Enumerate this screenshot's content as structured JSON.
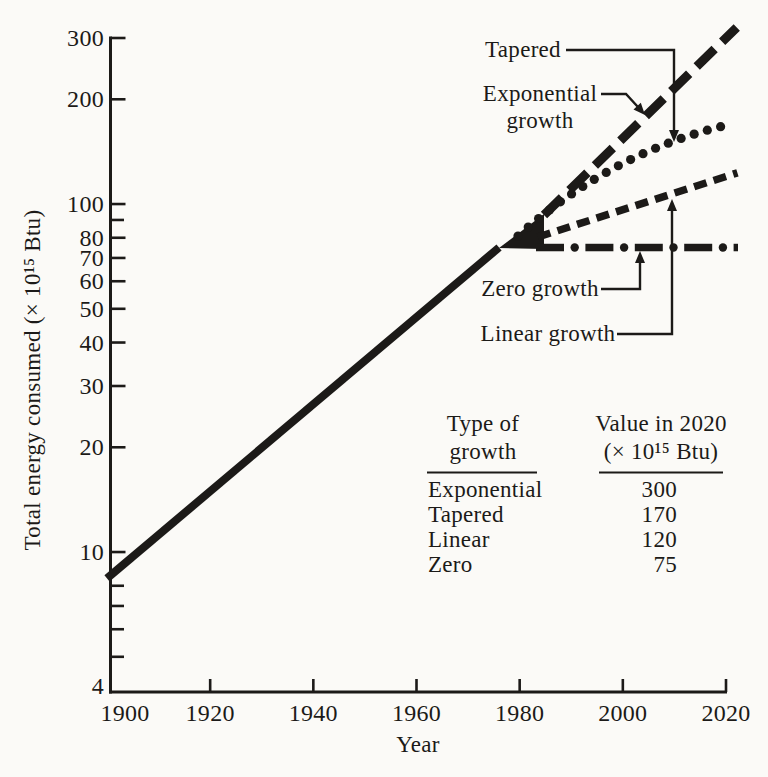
{
  "page": {
    "background": "#fbfaf7",
    "ink": "#1c1a18"
  },
  "chart_data": {
    "type": "line",
    "title": "",
    "xlabel": "Year",
    "ylabel": "Total energy consumed (× 10¹⁵ Btu)",
    "x_axis": {
      "min": 1900,
      "max": 2020,
      "tick_values": [
        1900,
        1920,
        1940,
        1960,
        1980,
        2000,
        2020
      ],
      "tick_labels": [
        "1900",
        "1920",
        "1940",
        "1960",
        "1980",
        "2000",
        "2020"
      ]
    },
    "y_axis": {
      "scale": "log",
      "min": 4,
      "max": 300,
      "labeled_ticks": [
        300,
        200,
        100,
        80,
        70,
        60,
        50,
        40,
        30,
        20,
        10,
        4
      ],
      "minor_ticks": [
        90,
        8,
        7,
        6,
        5
      ]
    },
    "series": [
      {
        "name": "historical",
        "label": "Historical consumption",
        "style": "solid",
        "points": [
          [
            1900,
            8.4
          ],
          [
            1976,
            75
          ]
        ]
      },
      {
        "name": "exponential-growth",
        "label": "Exponential growth",
        "style": "long-dash",
        "points": [
          [
            1976,
            75
          ],
          [
            2020,
            300
          ]
        ],
        "value_in_2020": 300
      },
      {
        "name": "tapered",
        "label": "Tapered",
        "style": "dotted",
        "points": [
          [
            1976,
            75
          ],
          [
            2020,
            170
          ]
        ],
        "value_in_2020": 170
      },
      {
        "name": "linear-growth",
        "label": "Linear growth",
        "style": "short-dash",
        "points": [
          [
            1976,
            75
          ],
          [
            2020,
            120
          ]
        ],
        "value_in_2020": 120
      },
      {
        "name": "zero-growth",
        "label": "Zero growth",
        "style": "dash-dot",
        "points": [
          [
            1976,
            75
          ],
          [
            2020,
            75
          ]
        ],
        "value_in_2020": 75
      }
    ],
    "annotations": [
      {
        "lines": [
          "Tapered"
        ],
        "target": "tapered"
      },
      {
        "lines": [
          "Exponential",
          "growth"
        ],
        "target": "exponential-growth"
      },
      {
        "lines": [
          "Zero growth"
        ],
        "target": "zero-growth"
      },
      {
        "lines": [
          "Linear growth"
        ],
        "target": "linear-growth"
      }
    ],
    "inset_table": {
      "col_headers": [
        [
          "Type of",
          "growth"
        ],
        [
          "Value in 2020",
          "(× 10¹⁵ Btu)"
        ]
      ],
      "rows": [
        [
          "Exponential",
          "300"
        ],
        [
          "Tapered",
          "170"
        ],
        [
          "Linear",
          "120"
        ],
        [
          "Zero",
          "75"
        ]
      ]
    }
  }
}
